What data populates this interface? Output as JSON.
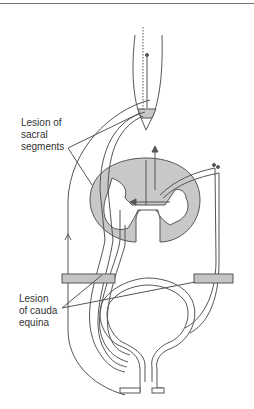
{
  "figure": {
    "labels": {
      "sacral_lesion": [
        "Lesion of",
        "sacral",
        "segments"
      ],
      "cauda_lesion": [
        "Lesion",
        "of cauda",
        "equina"
      ]
    },
    "colors": {
      "line": "#555555",
      "gray_matter_fill": "#c8c8c8",
      "lesion_fill": "#c4c4c4",
      "background": "#ffffff"
    },
    "structures": [
      "brain-stem-conus",
      "spinal-cord-cross-section",
      "bladder",
      "urethral-sphincter",
      "lesion-bars"
    ]
  }
}
